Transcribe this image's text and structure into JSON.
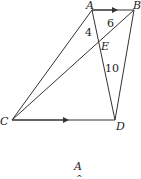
{
  "diagram": {
    "points": {
      "A": {
        "label": "A",
        "x": 92,
        "y": 10
      },
      "B": {
        "label": "B",
        "x": 134,
        "y": 10
      },
      "C": {
        "label": "C",
        "x": 12,
        "y": 120
      },
      "D": {
        "label": "D",
        "x": 115,
        "y": 120
      },
      "E": {
        "label": "E",
        "x": 100,
        "y": 42
      }
    },
    "segments": [
      {
        "from": "A",
        "to": "B",
        "arrow": true
      },
      {
        "from": "C",
        "to": "D",
        "arrow": true
      },
      {
        "from": "A",
        "to": "C"
      },
      {
        "from": "C",
        "to": "B"
      },
      {
        "from": "A",
        "to": "D"
      },
      {
        "from": "B",
        "to": "D"
      }
    ],
    "measures": {
      "AE": "4",
      "EB": "6",
      "ED": "10"
    },
    "footer_label": "A"
  }
}
